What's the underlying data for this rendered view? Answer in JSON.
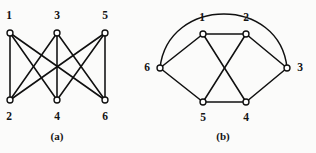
{
  "figure": {
    "background_color": "#fbfbfa",
    "stroke_color": "#101010",
    "vertex_fill_color": "#ffffff",
    "panels": [
      {
        "id": "panel-a",
        "caption": "(a)",
        "caption_x": 57,
        "caption_y": 137,
        "graph_name": "K3,3 bipartite drawing",
        "vertices": [
          {
            "label": "1",
            "x": 10,
            "y": 33,
            "r": 3.0,
            "label_x": 9,
            "label_y": 16
          },
          {
            "label": "3",
            "x": 57,
            "y": 33,
            "r": 3.0,
            "label_x": 57,
            "label_y": 16
          },
          {
            "label": "5",
            "x": 105,
            "y": 33,
            "r": 3.0,
            "label_x": 105,
            "label_y": 16
          },
          {
            "label": "2",
            "x": 10,
            "y": 100,
            "r": 3.0,
            "label_x": 9,
            "label_y": 117
          },
          {
            "label": "4",
            "x": 57,
            "y": 100,
            "r": 3.0,
            "label_x": 57,
            "label_y": 117
          },
          {
            "label": "6",
            "x": 105,
            "y": 100,
            "r": 3.0,
            "label_x": 105,
            "label_y": 117
          }
        ],
        "edges": [
          {
            "from": "1",
            "to": "2",
            "x1": 10,
            "y1": 33,
            "x2": 10,
            "y2": 100
          },
          {
            "from": "1",
            "to": "4",
            "x1": 10,
            "y1": 33,
            "x2": 57,
            "y2": 100
          },
          {
            "from": "1",
            "to": "6",
            "x1": 10,
            "y1": 33,
            "x2": 105,
            "y2": 100
          },
          {
            "from": "3",
            "to": "2",
            "x1": 57,
            "y1": 33,
            "x2": 10,
            "y2": 100
          },
          {
            "from": "3",
            "to": "4",
            "x1": 57,
            "y1": 33,
            "x2": 57,
            "y2": 100
          },
          {
            "from": "3",
            "to": "6",
            "x1": 57,
            "y1": 33,
            "x2": 105,
            "y2": 100
          },
          {
            "from": "5",
            "to": "2",
            "x1": 105,
            "y1": 33,
            "x2": 10,
            "y2": 100
          },
          {
            "from": "5",
            "to": "4",
            "x1": 105,
            "y1": 33,
            "x2": 57,
            "y2": 100
          },
          {
            "from": "5",
            "to": "6",
            "x1": 105,
            "y1": 33,
            "x2": 105,
            "y2": 100
          }
        ],
        "arcs": []
      },
      {
        "id": "panel-b",
        "caption": "(b)",
        "caption_x": 223,
        "caption_y": 137,
        "graph_name": "K3,3 circular drawing",
        "vertices": [
          {
            "label": "1",
            "x": 203,
            "y": 34,
            "r": 3.0,
            "label_x": 202,
            "label_y": 18
          },
          {
            "label": "2",
            "x": 246,
            "y": 34,
            "r": 3.0,
            "label_x": 246,
            "label_y": 18
          },
          {
            "label": "3",
            "x": 287,
            "y": 68,
            "r": 3.0,
            "label_x": 300,
            "label_y": 68
          },
          {
            "label": "4",
            "x": 246,
            "y": 102,
            "r": 3.0,
            "label_x": 246,
            "label_y": 118
          },
          {
            "label": "5",
            "x": 203,
            "y": 102,
            "r": 3.0,
            "label_x": 203,
            "label_y": 118
          },
          {
            "label": "6",
            "x": 160,
            "y": 68,
            "r": 3.0,
            "label_x": 147,
            "label_y": 68
          }
        ],
        "edges": [
          {
            "from": "1",
            "to": "2",
            "x1": 203,
            "y1": 34,
            "x2": 246,
            "y2": 34
          },
          {
            "from": "1",
            "to": "6",
            "x1": 203,
            "y1": 34,
            "x2": 160,
            "y2": 68
          },
          {
            "from": "1",
            "to": "4",
            "x1": 203,
            "y1": 34,
            "x2": 246,
            "y2": 102
          },
          {
            "from": "2",
            "to": "3",
            "x1": 246,
            "y1": 34,
            "x2": 287,
            "y2": 68
          },
          {
            "from": "2",
            "to": "5",
            "x1": 246,
            "y1": 34,
            "x2": 203,
            "y2": 102
          },
          {
            "from": "3",
            "to": "4",
            "x1": 287,
            "y1": 68,
            "x2": 246,
            "y2": 102
          },
          {
            "from": "4",
            "to": "5",
            "x1": 246,
            "y1": 102,
            "x2": 203,
            "y2": 102
          },
          {
            "from": "5",
            "to": "6",
            "x1": 203,
            "y1": 102,
            "x2": 160,
            "y2": 68
          }
        ],
        "arcs": [
          {
            "from": "6",
            "to": "3",
            "path": "M 160 68 C 168 -4 280 -4 287 68"
          }
        ]
      }
    ]
  }
}
